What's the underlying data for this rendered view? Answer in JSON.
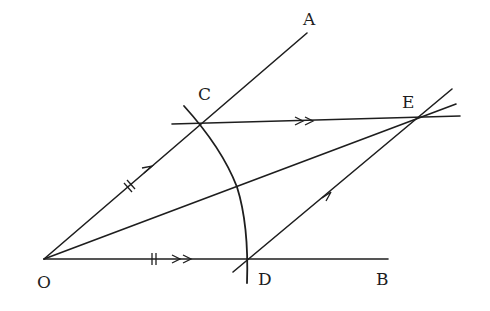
{
  "diagram": {
    "type": "geometric-construction",
    "stroke_color": "#1e1e1e",
    "background": "#ffffff",
    "points": {
      "O": {
        "label": "O",
        "x": 44,
        "y": 259
      },
      "A": {
        "label": "A",
        "x": 307,
        "y": 33
      },
      "B": {
        "label": "B",
        "x": 388,
        "y": 259
      },
      "C": {
        "label": "C",
        "x": 202,
        "y": 123
      },
      "D": {
        "label": "D",
        "x": 249,
        "y": 259
      },
      "E": {
        "label": "E",
        "x": 417,
        "y": 117
      }
    },
    "labels": {
      "O": "O",
      "A": "A",
      "B": "B",
      "C": "C",
      "D": "D",
      "E": "E"
    },
    "segments": [
      {
        "name": "ray-OA",
        "from": "O",
        "to": "A"
      },
      {
        "name": "ray-OB",
        "from": "O",
        "to": "B"
      },
      {
        "name": "line-CE",
        "from": "C",
        "to": "E",
        "note": "parallel to OB, marked with double arrows"
      },
      {
        "name": "line-DE",
        "from": "D",
        "to": "E",
        "note": "parallel to OA, marked with single arrow"
      },
      {
        "name": "diagonal-OE",
        "from": "O",
        "to": "E"
      }
    ],
    "arc": {
      "center": "O",
      "through": [
        "C",
        "D"
      ]
    },
    "tick_marks": {
      "OC": "double tick (equal length)",
      "OD": "double tick (equal length)"
    }
  }
}
